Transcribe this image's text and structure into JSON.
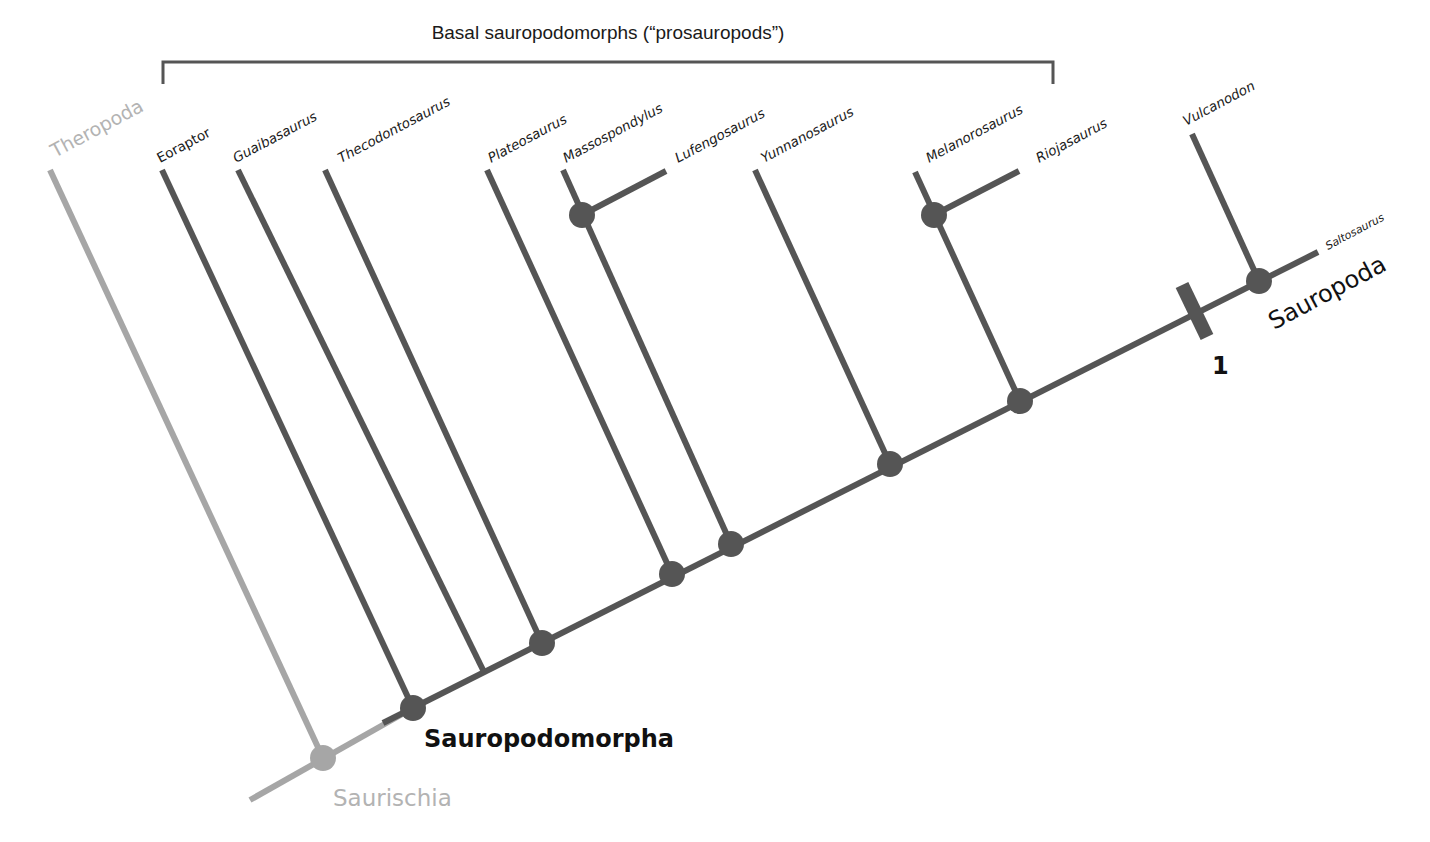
{
  "colors": {
    "branch": "#555555",
    "theropod_branch": "#a6a6a6",
    "saurischia_node": "#a6a6a6",
    "text": "#1a1a1a",
    "grey_text": "#b3b3b3"
  },
  "bracket": {
    "label": "Basal sauropodomorphs (“prosauropods”)",
    "x1": 163,
    "x2": 1053,
    "y": 62,
    "tick_down": 22
  },
  "clades": {
    "saurischia": "Saurischia",
    "sauropodomorpha": "Sauropodomorpha",
    "sauropoda": "Sauropoda"
  },
  "marker": {
    "label": "1"
  },
  "taxa": [
    {
      "name": "Theropoda",
      "grey": true
    },
    {
      "name": "Eoraptor"
    },
    {
      "name": "Guaibasaurus"
    },
    {
      "name": "Thecodontosaurus"
    },
    {
      "name": "Plateosaurus"
    },
    {
      "name": "Massospondylus"
    },
    {
      "name": "Lufengosaurus"
    },
    {
      "name": "Yunnanosaurus"
    },
    {
      "name": "Melanorosaurus"
    },
    {
      "name": "Riojasaurus"
    },
    {
      "name": "Vulcanodon"
    },
    {
      "name": "Saltosaurus"
    }
  ],
  "tree": {
    "spine": {
      "x1": 250,
      "y1": 800,
      "x2": 1318,
      "y2": 252
    },
    "lines": [
      {
        "x1": 50,
        "y1": 170,
        "x2": 323,
        "y2": 758,
        "grey": true
      },
      {
        "x1": 162,
        "y1": 170,
        "x2": 413,
        "y2": 708
      },
      {
        "x1": 238,
        "y1": 170,
        "x2": 484,
        "y2": 672
      },
      {
        "x1": 325,
        "y1": 170,
        "x2": 542,
        "y2": 643
      },
      {
        "x1": 487,
        "y1": 170,
        "x2": 672,
        "y2": 574
      },
      {
        "x1": 563,
        "y1": 170,
        "x2": 731,
        "y2": 544
      },
      {
        "x1": 582,
        "y1": 215,
        "x2": 666,
        "y2": 171
      },
      {
        "x1": 755,
        "y1": 170,
        "x2": 890,
        "y2": 464
      },
      {
        "x1": 915,
        "y1": 172,
        "x2": 1020,
        "y2": 401
      },
      {
        "x1": 934,
        "y1": 215,
        "x2": 1019,
        "y2": 171
      },
      {
        "x1": 1192,
        "y1": 134,
        "x2": 1259,
        "y2": 281
      }
    ],
    "nodes": [
      {
        "x": 323,
        "y": 758,
        "grey": true
      },
      {
        "x": 413,
        "y": 708
      },
      {
        "x": 542,
        "y": 643
      },
      {
        "x": 672,
        "y": 574
      },
      {
        "x": 731,
        "y": 544
      },
      {
        "x": 582,
        "y": 215
      },
      {
        "x": 890,
        "y": 464
      },
      {
        "x": 934,
        "y": 215
      },
      {
        "x": 1020,
        "y": 401
      },
      {
        "x": 1259,
        "y": 281
      }
    ],
    "synapomorphy_bar": {
      "x1": 1182,
      "y1": 285,
      "x2": 1207,
      "y2": 337
    }
  }
}
